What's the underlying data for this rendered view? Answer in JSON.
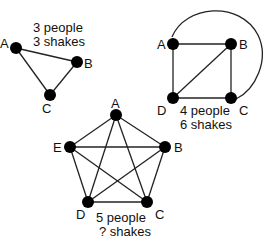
{
  "graphs": [
    {
      "id": "three",
      "caption": [
        "3 people",
        "3 shakes"
      ],
      "nodes": {
        "A": "A",
        "B": "B",
        "C": "C"
      }
    },
    {
      "id": "four",
      "caption": [
        "4 people",
        "6 shakes"
      ],
      "nodes": {
        "A": "A",
        "B": "B",
        "C": "C",
        "D": "D"
      }
    },
    {
      "id": "five",
      "caption": [
        "5 people",
        "? shakes"
      ],
      "nodes": {
        "A": "A",
        "B": "B",
        "C": "C",
        "D": "D",
        "E": "E"
      }
    }
  ]
}
